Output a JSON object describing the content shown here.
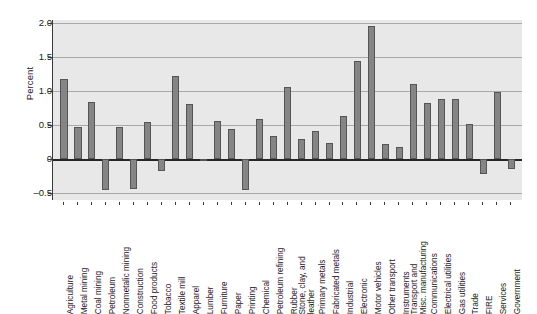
{
  "chart_data": {
    "type": "bar",
    "title": "",
    "xlabel": "",
    "ylabel": "Percent",
    "ylim": [
      -0.6,
      2.05
    ],
    "yticks": [
      2.0,
      1.5,
      1.0,
      0.5,
      0,
      -0.5
    ],
    "ytick_labels": [
      "2.0",
      "1.5",
      "1.0",
      "0.5",
      "0",
      "–0.5"
    ],
    "grid": true,
    "legend": "none",
    "orientation": "vertical",
    "bar_color": "#858585",
    "plot_bg": "#e8e8e8",
    "categories": [
      "Agriculture",
      "Metal mining",
      "Coal mining",
      "Petroleum",
      "Nonmetalic mining",
      "Construction",
      "Food products",
      "Tobacco",
      "Textile mill",
      "Apparel",
      "Lumber",
      "Furniture",
      "Paper",
      "Printing",
      "Chemical",
      "Petroleum refining",
      "Rubber",
      "Stone, clay, and leather",
      "Primary metals",
      "Fabricated metals",
      "Industrial",
      "Electronic",
      "Motor vehicles",
      "Other transport",
      "Instruments",
      "Transport and Misc. manufacturing",
      "Communications",
      "Electrical utilities",
      "Gas utilities",
      "Trade",
      "FIRE",
      "Services",
      "Government"
    ],
    "values": [
      1.18,
      0.47,
      0.85,
      -0.45,
      0.47,
      -0.44,
      0.55,
      -0.17,
      1.23,
      0.82,
      -0.02,
      0.56,
      0.45,
      -0.46,
      0.59,
      0.34,
      1.06,
      0.3,
      0.42,
      0.24,
      0.64,
      1.44,
      1.96,
      0.22,
      0.18,
      1.11,
      0.83,
      0.89,
      0.89,
      0.52,
      -0.22,
      0.99,
      -0.14
    ],
    "values_extra_note": ""
  },
  "figure": {
    "ylabel": "Percent"
  }
}
